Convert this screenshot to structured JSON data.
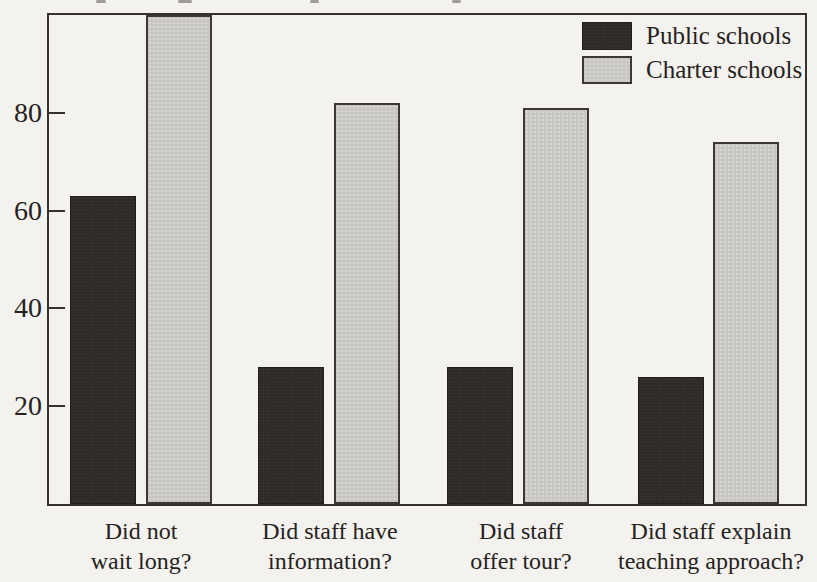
{
  "chart_data": {
    "type": "bar",
    "title": "",
    "categories": [
      "Did not\nwait long?",
      "Did staff have\ninformation?",
      "Did staff\noffer tour?",
      "Did staff explain\nteaching approach?"
    ],
    "series": [
      {
        "name": "Public schools",
        "color": "#2e2b28",
        "values": [
          63,
          28,
          28,
          26
        ]
      },
      {
        "name": "Charter schools",
        "color": "#c8c6c2",
        "values": [
          100,
          82,
          81,
          74
        ]
      }
    ],
    "xlabel": "",
    "ylabel": "",
    "ylim": [
      0,
      100
    ],
    "yticks": [
      20,
      40,
      60,
      80
    ],
    "grid": false,
    "legend_position": "top-right",
    "background": "#f4f2ef",
    "frame_color": "#35312b",
    "text_color": "#262220",
    "note": "Charter schools bar for 'Did not wait long?' reaches the top frame of the plot"
  }
}
